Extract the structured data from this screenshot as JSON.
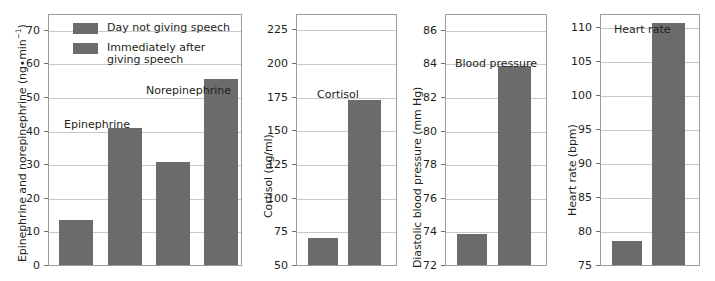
{
  "chart_data": {
    "type": "bar",
    "title": "",
    "subtitle": "",
    "grid": true,
    "legend_position": "inside-top-left-of-first-panel",
    "legend": [
      {
        "label": "Day not giving speech",
        "color": "#6b6b6b"
      },
      {
        "label": "Immediately after\ngiving speech",
        "color": "#6b6b6b"
      }
    ],
    "panels": [
      {
        "id": "catecholamines",
        "ylabel": "Epinephrine and norepinephrine (ng•min",
        "ylabel_sup": "−1",
        "ylabel_tail": ")",
        "yunit": "ng•min⁻¹",
        "ylim": [
          0,
          75
        ],
        "yticks": [
          0,
          10,
          20,
          30,
          40,
          50,
          60,
          70
        ],
        "yticklabels": [
          "0",
          "10",
          "20",
          "30",
          "40",
          "50",
          "60",
          "70"
        ],
        "annotations": [
          {
            "text": "Epinephrine",
            "value_x": 0.5
          },
          {
            "text": "Norepinephrine",
            "value_x": 2.5
          }
        ],
        "categories": [
          "Epinephrine",
          "Norepinephrine"
        ],
        "series": [
          {
            "name": "Day not giving speech",
            "values": [
              13.7,
              31.0
            ]
          },
          {
            "name": "Immediately after giving speech",
            "values": [
              41.0,
              55.8
            ]
          }
        ],
        "bars": [
          13.7,
          41.0,
          31.0,
          55.8
        ]
      },
      {
        "id": "cortisol",
        "ylabel": "Cortisol (ng/ml)",
        "yunit": "ng/ml",
        "ylim": [
          50,
          237
        ],
        "yticks": [
          50,
          75,
          100,
          125,
          150,
          175,
          200,
          225
        ],
        "yticklabels": [
          "50",
          "75",
          "100",
          "125",
          "150",
          "175",
          "200",
          "225"
        ],
        "annotations": [
          {
            "text": "Cortisol"
          }
        ],
        "categories": [
          "Cortisol"
        ],
        "series": [
          {
            "name": "Day not giving speech",
            "values": [
              71
            ]
          },
          {
            "name": "Immediately after giving speech",
            "values": [
              173
            ]
          }
        ],
        "bars": [
          71,
          173
        ]
      },
      {
        "id": "blood-pressure",
        "ylabel": "Diastolic blood pressure (mm Hg)",
        "yunit": "mm Hg",
        "ylim": [
          72,
          87
        ],
        "yticks": [
          72,
          74,
          76,
          78,
          80,
          82,
          84,
          86
        ],
        "yticklabels": [
          "72",
          "74",
          "76",
          "78",
          "80",
          "82",
          "84",
          "86"
        ],
        "annotations": [
          {
            "text": "Blood pressure"
          }
        ],
        "categories": [
          "Blood pressure"
        ],
        "series": [
          {
            "name": "Day not giving speech",
            "values": [
              73.9
            ]
          },
          {
            "name": "Immediately after giving speech",
            "values": [
              83.9
            ]
          }
        ],
        "bars": [
          73.9,
          83.9
        ]
      },
      {
        "id": "heart-rate",
        "ylabel": "Heart rate (bpm)",
        "yunit": "bpm",
        "ylim": [
          75,
          112
        ],
        "yticks": [
          75,
          80,
          85,
          90,
          95,
          100,
          105,
          110
        ],
        "yticklabels": [
          "75",
          "80",
          "85",
          "90",
          "95",
          "100",
          "105",
          "110"
        ],
        "annotations": [
          {
            "text": "Heart rate"
          }
        ],
        "categories": [
          "Heart rate"
        ],
        "series": [
          {
            "name": "Day not giving speech",
            "values": [
              78.7
            ]
          },
          {
            "name": "Immediately after giving speech",
            "values": [
              110.7
            ]
          }
        ],
        "bars": [
          78.7,
          110.7
        ]
      }
    ],
    "colors": {
      "bar": "#6b6b6b",
      "grid": "#c9c9c9",
      "frame": "#9b9b9b",
      "text": "#231f20"
    }
  }
}
